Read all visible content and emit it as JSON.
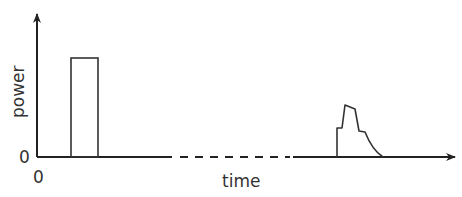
{
  "axes": {
    "y_label": "power",
    "x_label": "time",
    "y_origin_label": "0",
    "x_origin_label": "0"
  },
  "elements": {
    "first_pulse": "rectangular pulse",
    "gap": "dashed time break",
    "second_pulse": "stepped pulse with decaying tail"
  },
  "colors": {
    "line": "#333333",
    "background": "#ffffff"
  }
}
